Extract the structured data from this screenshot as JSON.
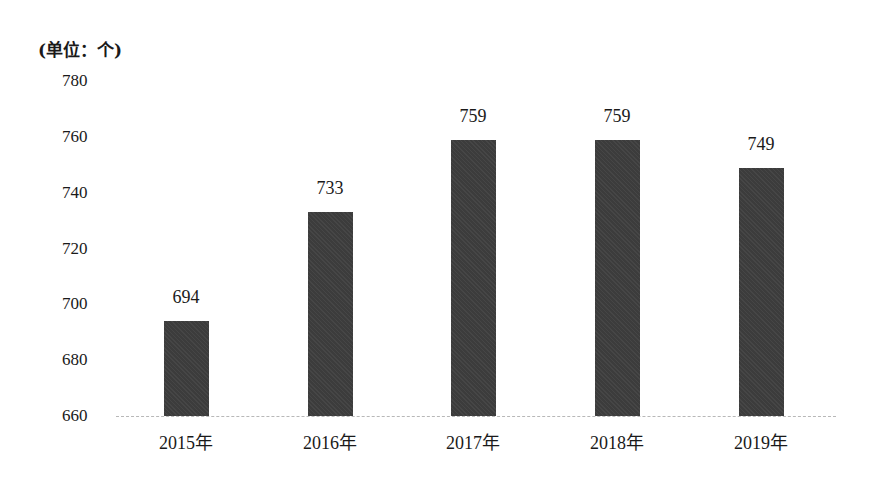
{
  "chart_data": {
    "type": "bar",
    "title": "",
    "unit_label": "(单位：个)",
    "xlabel": "",
    "ylabel": "(单位：个)",
    "categories": [
      "2015年",
      "2016年",
      "2017年",
      "2018年",
      "2019年"
    ],
    "values": [
      694,
      733,
      759,
      759,
      749
    ],
    "data_labels": [
      "694",
      "733",
      "759",
      "759",
      "749"
    ],
    "ylim": [
      660,
      780
    ],
    "yticks": [
      660,
      680,
      700,
      720,
      740,
      760,
      780
    ],
    "ytick_labels": [
      "660",
      "680",
      "700",
      "720",
      "740",
      "760",
      "780"
    ],
    "grid": false,
    "legend": null,
    "bar_color": "#3c3c3c"
  }
}
